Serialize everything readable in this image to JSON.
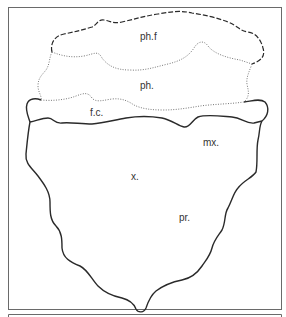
{
  "figure": {
    "labels": {
      "phf": "ph.f",
      "ph": "ph.",
      "fc": "f.c.",
      "mx": "mx.",
      "x": "x.",
      "pr": "pr."
    },
    "colors": {
      "line": "#2a2a2a",
      "frame": "#555555",
      "dotted": "#777777"
    }
  }
}
